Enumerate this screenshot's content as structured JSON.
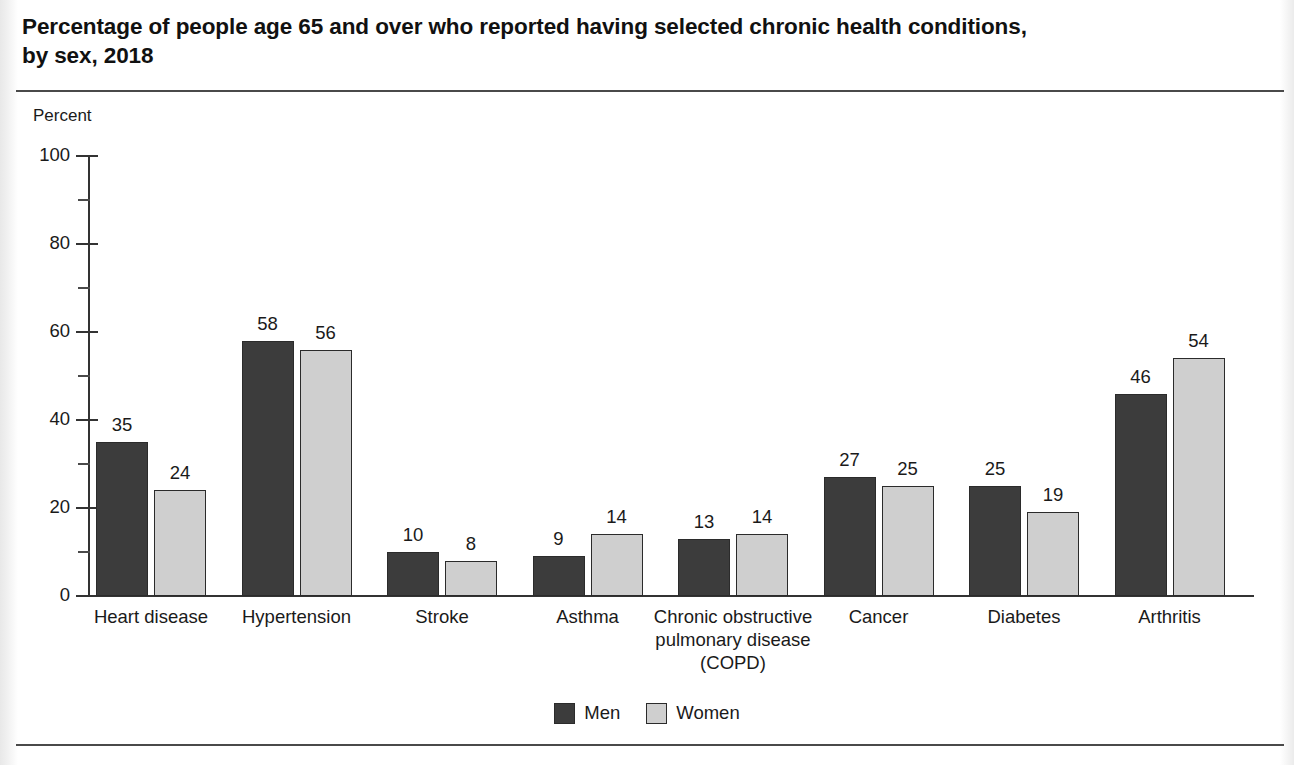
{
  "title": {
    "line1": "Percentage of people age 65 and over who reported having selected chronic health conditions,",
    "line2": "by sex, 2018"
  },
  "axis_unit_label": "Percent",
  "legend": {
    "items": [
      {
        "label": "Men",
        "color": "#3c3c3c"
      },
      {
        "label": "Women",
        "color": "#cfcfcf"
      }
    ]
  },
  "chart_data": {
    "type": "bar",
    "title": "Percentage of people age 65 and over who reported having selected chronic health conditions, by sex, 2018",
    "xlabel": "",
    "ylabel": "Percent",
    "ylim": [
      0,
      100
    ],
    "yticks": [
      0,
      20,
      40,
      60,
      80,
      100
    ],
    "ytick_labels": [
      "0",
      "20",
      "40",
      "60",
      "80",
      "100"
    ],
    "yminor_ticks": [
      10,
      30,
      50,
      70,
      90
    ],
    "grid": false,
    "legend_position": "bottom-center",
    "categories": [
      "Heart disease",
      "Hypertension",
      "Stroke",
      "Asthma",
      "Chronic obstructive pulmonary disease (COPD)",
      "Cancer",
      "Diabetes",
      "Arthritis"
    ],
    "category_label_lines": [
      [
        "Heart disease"
      ],
      [
        "Hypertension"
      ],
      [
        "Stroke"
      ],
      [
        "Asthma"
      ],
      [
        "Chronic obstructive",
        "pulmonary disease",
        "(COPD)"
      ],
      [
        "Cancer"
      ],
      [
        "Diabetes"
      ],
      [
        "Arthritis"
      ]
    ],
    "series": [
      {
        "name": "Men",
        "color": "#3c3c3c",
        "values": [
          35,
          58,
          10,
          9,
          13,
          27,
          25,
          46
        ]
      },
      {
        "name": "Women",
        "color": "#cfcfcf",
        "values": [
          24,
          56,
          8,
          14,
          14,
          25,
          19,
          54
        ]
      }
    ]
  }
}
